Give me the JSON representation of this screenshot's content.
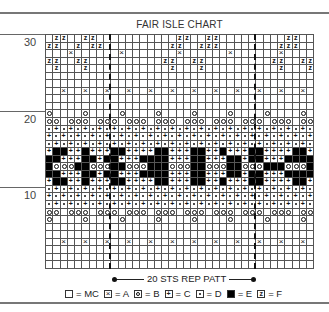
{
  "title": "FAIR ISLE CHART",
  "row_labels": [
    {
      "label": "30",
      "top": 34
    },
    {
      "label": "20",
      "top": 111
    },
    {
      "label": "10",
      "top": 187
    }
  ],
  "grid": {
    "columns": 37,
    "rows_count": 31,
    "repeat_markers_col": [
      9,
      29
    ],
    "rows": [
      ".FF..FF...........FF..FF.........FF..",
      "FF..F.FF.........FF..FFF........FFF..",
      "...A......A.......A......A......A....",
      "FF..FF..........FF..FF.........FF..FF",
      ".F...F...........F...F..........F...F",
      ".....................................",
      ".....................................",
      "..A..A..A..A..A..A..A..A..A..A..A..A.",
      ".....................................",
      ".....................................",
      "B....B....B....B....B....B....B....B.",
      "BB.BBB.BBB.BBB.BBB.BBB.BBB.BBB.BBB.BB",
      "DCDCDCDCDCDCDCDCDCDCDCDCDCDCDCDCDCDCD",
      "CDCDCDCDCDCDCDCDCDCDCDCDCDCDCDCDCDCDC",
      "DCDCDCDCDCDCDCDCDCDCDCDCDCDCDCDCDCDCD",
      "CEECCECCCEECCCCEECCCEECCECCCEECCCCEEC",
      "EECCCEECEECCCEEEECCCEECCCEECEECCCEEEE",
      "EBBBEEBBBEEBBBEEEBBBEEBBBEEBBBEEEBBBE",
      "EECCCEECEECCCEEEECCCEECCCEECEECCCEEEE",
      "CEECCECCCEECCCCEECCCEECCECCCEECCCCEEC",
      "DCDCDCDCDCDCDCDCDCDCDCDCDCDCDCDCDCDCD",
      "CDCDCDCDCDCDCDCDCDCDCDCDCDCDCDCDCDCDC",
      "DCDCDCDCDCDCDCDCDCDCDCDCDCDCDCDCDCDCD",
      "BB.BBB.BBB.BBB.BBB.BBB.BBB.BBB.BBB.BB",
      "B....B....B....B....B....B....B....B.",
      ".....................................",
      ".....................................",
      "..A..A..A..A..A..A..A..A..A..A..A..A.",
      ".....................................",
      ".....................................",
      "....................................."
    ]
  },
  "repeat": {
    "label": "20 STS REP PATT"
  },
  "legend": [
    {
      "symbol": "MC",
      "label": "= MC"
    },
    {
      "symbol": "A",
      "label": "= A"
    },
    {
      "symbol": "B",
      "label": "= B"
    },
    {
      "symbol": "C",
      "label": "= C"
    },
    {
      "symbol": "D",
      "label": "= D"
    },
    {
      "symbol": "E",
      "label": "= E"
    },
    {
      "symbol": "F",
      "label": "= F"
    }
  ]
}
